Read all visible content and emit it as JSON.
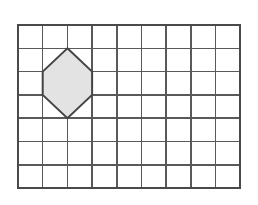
{
  "figure": {
    "name": "grid-hexagon-diagram",
    "type": "geometry-grid-diagram",
    "background_color": "#ffffff",
    "width": 258,
    "height": 205
  },
  "grid": {
    "name": "square-grid",
    "columns": 9,
    "rows": 7,
    "origin_x": 18,
    "origin_y": 25,
    "cell_width": 24.7,
    "cell_height": 23.3,
    "line_color": "#595959",
    "line_width": 1.5,
    "border_color": "#4a4a4a",
    "border_width": 1.7,
    "total_width": 222.3,
    "total_height": 163.1
  },
  "shapes": [
    {
      "name": "shaded-hexagon",
      "type": "hexagon",
      "fill_color": "#e3e3e3",
      "stroke_color": "#444444",
      "stroke_width": 2,
      "vertices_grid": [
        [
          2,
          1
        ],
        [
          3,
          2
        ],
        [
          3,
          3
        ],
        [
          2,
          4
        ],
        [
          1,
          3
        ],
        [
          1,
          2
        ]
      ],
      "vertices_px": [
        [
          67.4,
          48.3
        ],
        [
          92.1,
          71.6
        ],
        [
          92.1,
          94.9
        ],
        [
          67.4,
          118.2
        ],
        [
          42.7,
          94.9
        ],
        [
          42.7,
          71.6
        ]
      ],
      "area_cells": 4
    }
  ],
  "chart_data": {
    "type": "table",
    "title": "",
    "categories": [
      "grid-columns",
      "grid-rows",
      "hexagon-vertices",
      "hexagon-area-cells"
    ],
    "values": [
      9,
      7,
      6,
      4
    ]
  }
}
